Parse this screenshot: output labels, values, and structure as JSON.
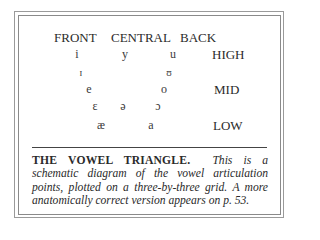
{
  "diagram": {
    "columns": [
      {
        "label": "FRONT",
        "x": 54
      },
      {
        "label": "CENTRAL",
        "x": 111
      },
      {
        "label": "BACK",
        "x": 180
      }
    ],
    "rows": [
      {
        "label": "HIGH",
        "x": 212,
        "y": 48
      },
      {
        "label": "MID",
        "x": 214,
        "y": 83
      },
      {
        "label": "LOW",
        "x": 213,
        "y": 119
      }
    ],
    "vowels": [
      {
        "symbol": "i",
        "x": 76,
        "y": 48,
        "size": "normal"
      },
      {
        "symbol": "y",
        "x": 124,
        "y": 48,
        "size": "normal"
      },
      {
        "symbol": "u",
        "x": 172,
        "y": 48,
        "size": "normal"
      },
      {
        "symbol": "ɪ",
        "x": 81,
        "y": 68,
        "size": "small"
      },
      {
        "symbol": "ʊ",
        "x": 169,
        "y": 68,
        "size": "small"
      },
      {
        "symbol": "e",
        "x": 88,
        "y": 83,
        "size": "normal"
      },
      {
        "symbol": "o",
        "x": 163,
        "y": 83,
        "size": "normal"
      },
      {
        "symbol": "ɛ",
        "x": 94,
        "y": 100,
        "size": "normal"
      },
      {
        "symbol": "ə",
        "x": 122,
        "y": 100,
        "size": "normal"
      },
      {
        "symbol": "ɔ",
        "x": 157,
        "y": 100,
        "size": "normal"
      },
      {
        "symbol": "æ",
        "x": 99,
        "y": 119,
        "size": "normal"
      },
      {
        "symbol": "a",
        "x": 150,
        "y": 119,
        "size": "normal"
      }
    ]
  },
  "caption": {
    "title": "THE VOWEL TRIANGLE.",
    "body": "This is a schematic diagram of the vowel articulation points, plotted on a three-by-three grid. A more anatomically correct version appears on p. 53."
  },
  "colors": {
    "text": "#2a2a2a",
    "border": "#9a9a9a",
    "background": "#ffffff"
  }
}
